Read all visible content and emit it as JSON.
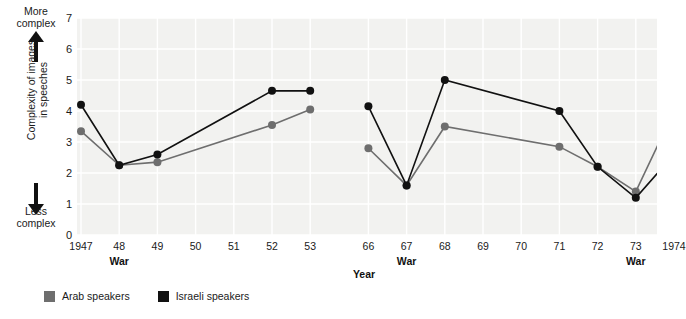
{
  "axis_annotations": {
    "top_label": "More\ncomplex",
    "bottom_label": "Less\ncomplex",
    "y_title": "Complexity of images\nin speeches",
    "up_arrow_icon": "arrow-up-icon",
    "down_arrow_icon": "arrow-down-icon"
  },
  "legend": {
    "items": [
      {
        "label": "Arab speakers",
        "color": "#6e6e6e",
        "key": "arab"
      },
      {
        "label": "Israeli speakers",
        "color": "#111111",
        "key": "israeli"
      }
    ]
  },
  "chart_data": {
    "type": "line",
    "title": "",
    "xlabel": "Year",
    "ylabel": "Complexity of images in speeches",
    "ylim": [
      0,
      7
    ],
    "yticks": [
      0,
      1,
      2,
      3,
      4,
      5,
      6,
      7
    ],
    "grid": true,
    "legend_position": "bottom-left",
    "panels": [
      {
        "name": "1947-1953",
        "categories": [
          "1947",
          "48",
          "49",
          "50",
          "51",
          "52",
          "53"
        ],
        "war_markers": [
          "48"
        ],
        "series": [
          {
            "name": "Israeli speakers",
            "color": "#111111",
            "x": [
              "1947",
              "48",
              "49",
              "52",
              "53"
            ],
            "values": [
              4.2,
              2.25,
              2.6,
              4.65,
              4.65
            ]
          },
          {
            "name": "Arab speakers",
            "color": "#6e6e6e",
            "x": [
              "1947",
              "48",
              "49",
              "52",
              "53"
            ],
            "values": [
              3.35,
              2.25,
              2.35,
              3.55,
              4.05
            ]
          }
        ]
      },
      {
        "name": "1966-1974",
        "categories": [
          "66",
          "67",
          "68",
          "69",
          "70",
          "71",
          "72",
          "73",
          "1974"
        ],
        "war_markers": [
          "67",
          "73"
        ],
        "series": [
          {
            "name": "Israeli speakers",
            "color": "#111111",
            "x": [
              "66",
              "67",
              "68",
              "71",
              "72",
              "73",
              "1974"
            ],
            "values": [
              4.15,
              1.6,
              5.0,
              4.0,
              2.2,
              1.2,
              2.6
            ]
          },
          {
            "name": "Arab speakers",
            "color": "#6e6e6e",
            "x": [
              "66",
              "67",
              "68",
              "71",
              "72",
              "73",
              "1974"
            ],
            "values": [
              2.8,
              1.6,
              3.5,
              2.85,
              2.2,
              1.4,
              4.0
            ]
          }
        ]
      }
    ]
  },
  "colors": {
    "plot_background": "#f2f2f0",
    "gridline": "#ffffff",
    "israeli": "#111111",
    "arab": "#6e6e6e"
  }
}
